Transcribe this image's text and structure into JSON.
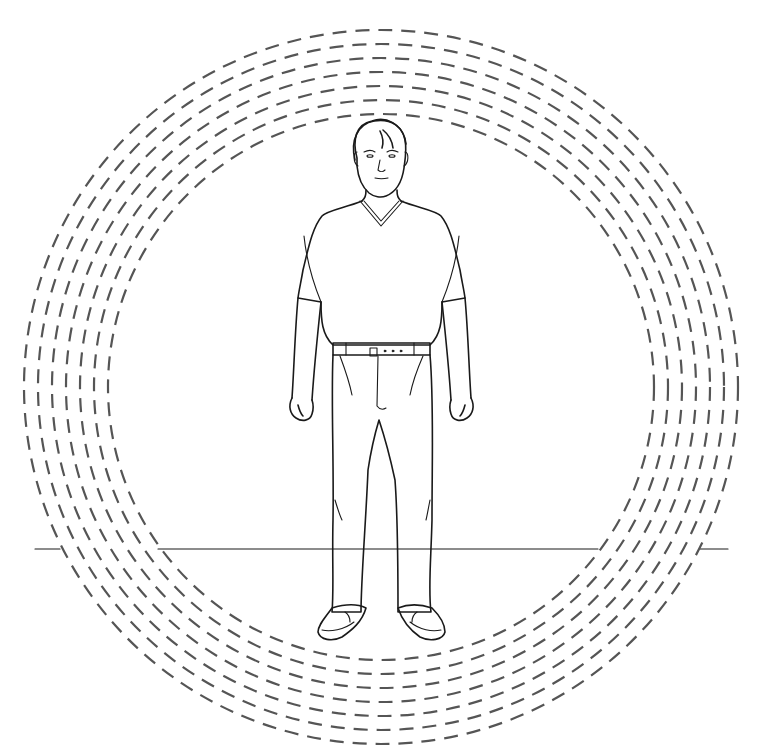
{
  "illustration": {
    "subject": "standing man in v-neck t-shirt and trousers surrounded by concentric dashed rings",
    "background_color": "#ffffff",
    "ink_color": "#1a1a1a",
    "ring_color": "#555555",
    "rings": {
      "count": 7,
      "center": [
        381,
        387
      ],
      "outer_radius": 357,
      "spacing": 14,
      "dash": [
        14,
        9
      ]
    },
    "floor_line": {
      "y": 549,
      "segments": [
        [
          35,
          60
        ],
        [
          158,
          598
        ],
        [
          700,
          728
        ]
      ]
    }
  }
}
